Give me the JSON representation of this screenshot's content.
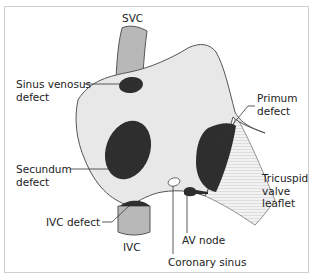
{
  "diagram": {
    "type": "atrial septal defect anatomy (right atrial view)",
    "colors": {
      "atrium_fill": "#e8e8e8",
      "vessel_fill": "#b8b8b8",
      "defect_fill": "#2e2e2e",
      "outline": "#555555",
      "leaflet_fill": "#f0f0f0",
      "frame_border": "#cfcfcf",
      "text": "#222222"
    },
    "labels": {
      "svc": "SVC",
      "sinus_venosus": [
        "Sinus venosus",
        "defect"
      ],
      "primum": [
        "Primum",
        "defect"
      ],
      "secundum": [
        "Secundum",
        "defect"
      ],
      "tricuspid": [
        "Tricuspid",
        "valve",
        "leaflet"
      ],
      "ivc_defect": "IVC defect",
      "av_node": "AV node",
      "ivc": "IVC",
      "coronary_sinus": "Coronary sinus"
    }
  }
}
